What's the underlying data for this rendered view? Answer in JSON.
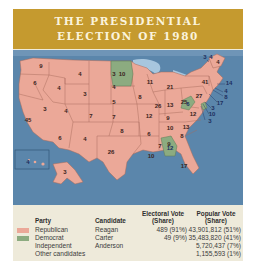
{
  "title": {
    "line1": "THE PRESIDENTIAL",
    "line2": "ELECTION OF 1980"
  },
  "colors": {
    "title_bg": "#c59a2f",
    "republican": "#eba898",
    "democrat": "#8cab80",
    "water": "#5b86ab",
    "card_bg": "#eeeada"
  },
  "map": {
    "electoral_votes": {
      "WA": "9",
      "OR": "6",
      "CA": "45",
      "ID": "4",
      "NV": "3",
      "MT": "4",
      "WY": "3",
      "UT": "4",
      "AZ": "6",
      "CO": "7",
      "NM": "4",
      "ND": "3",
      "SD": "4",
      "NE": "5",
      "KS": "7",
      "OK": "8",
      "TX": "26",
      "MN": "10",
      "IA": "8",
      "MO": "12",
      "AR": "6",
      "LA": "10",
      "WI": "11",
      "IL": "26",
      "MI": "21",
      "IN": "13",
      "OH": "25",
      "KY": "9",
      "TN": "10",
      "MS": "7",
      "AL": "9",
      "GA": "12",
      "FL": "17",
      "SC": "8",
      "NC": "13",
      "VA": "12",
      "WV": "6",
      "PA": "27",
      "NY": "41",
      "VT": "3",
      "NH": "4",
      "ME": "4",
      "MA": "14",
      "RI": "4",
      "CT": "8",
      "NJ": "17",
      "DE": "3",
      "MD": "10",
      "DC": "3",
      "AK": "3",
      "HI": "4"
    }
  },
  "legend": {
    "headers": {
      "party": "Party",
      "candidate": "Candidate",
      "electoral_line1": "Electoral Vote",
      "electoral_line2": "(Share)",
      "popular_line1": "Popular Vote",
      "popular_line2": "(Share)"
    },
    "rows": [
      {
        "party": "Republican",
        "candidate": "Reagan",
        "electoral": "489 (91%)",
        "popular": "43,901,812 (51%)"
      },
      {
        "party": "Democrat",
        "candidate": "Carter",
        "electoral": "49 (9%)",
        "popular": "35,483,820 (41%)"
      },
      {
        "party": "Independent",
        "candidate": "Anderson",
        "electoral": "",
        "popular": "5,720,437 (7%)"
      },
      {
        "party": "Other candidates",
        "candidate": "",
        "electoral": "",
        "popular": "1,155,593 (1%)"
      }
    ]
  }
}
